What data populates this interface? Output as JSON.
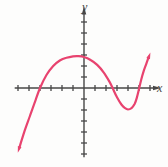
{
  "chart_data": {
    "type": "line",
    "title": "",
    "xlabel": "x",
    "ylabel": "y",
    "x_range": [
      -6.3,
      6.5
    ],
    "y_range": [
      -6.3,
      6.9
    ],
    "x_ticks": [
      -6,
      -5,
      -4,
      -3,
      -2,
      -1,
      1,
      2,
      3,
      4,
      5,
      6
    ],
    "y_ticks": [
      -6,
      -5,
      -4,
      -3,
      -2,
      -1,
      1,
      2,
      3,
      4,
      5,
      6
    ],
    "grid": false,
    "legend": false,
    "axis_color": "#474747",
    "background": "#fdfdfc",
    "series": [
      {
        "name": "polynomial-curve",
        "color": "#e8436f",
        "arrow_start": true,
        "arrow_end": true,
        "points": [
          [
            -5.9,
            -5.5
          ],
          [
            -5.4,
            -3.9
          ],
          [
            -4.9,
            -2.5
          ],
          [
            -4.4,
            -1.1
          ],
          [
            -4.0,
            0.0
          ],
          [
            -3.4,
            1.2
          ],
          [
            -2.8,
            2.0
          ],
          [
            -2.2,
            2.5
          ],
          [
            -1.6,
            2.75
          ],
          [
            -1.0,
            2.88
          ],
          [
            -0.5,
            2.9
          ],
          [
            0.0,
            2.82
          ],
          [
            0.6,
            2.55
          ],
          [
            1.2,
            2.1
          ],
          [
            1.8,
            1.4
          ],
          [
            2.3,
            0.6
          ],
          [
            2.6,
            0.0
          ],
          [
            3.0,
            -0.85
          ],
          [
            3.4,
            -1.5
          ],
          [
            3.7,
            -1.8
          ],
          [
            4.0,
            -1.95
          ],
          [
            4.3,
            -1.85
          ],
          [
            4.6,
            -1.45
          ],
          [
            4.8,
            -0.9
          ],
          [
            5.0,
            -0.1
          ],
          [
            5.2,
            0.75
          ],
          [
            5.45,
            1.6
          ],
          [
            5.7,
            2.3
          ],
          [
            5.9,
            2.85
          ]
        ]
      }
    ],
    "features": {
      "x_intercepts": [
        -4,
        2.6,
        5
      ],
      "y_intercept": 2.8,
      "local_max": [
        -0.5,
        2.9
      ],
      "local_min": [
        4,
        -2
      ]
    }
  }
}
